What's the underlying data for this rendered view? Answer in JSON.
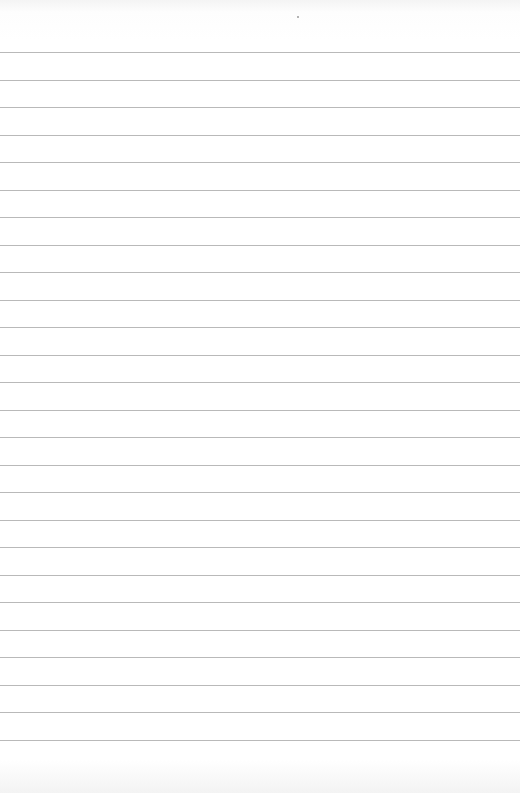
{
  "page": {
    "type": "blank-lined-paper",
    "background_color": "#ffffff",
    "rule_color": "#b9b9b9",
    "rule_count": 26,
    "first_rule_y": 52,
    "rule_spacing": 27.5
  }
}
